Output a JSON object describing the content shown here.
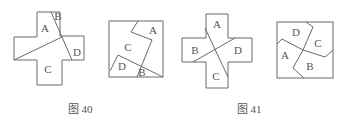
{
  "figures": [
    {
      "caption": "图 40",
      "cross": {
        "labels": {
          "A": "A",
          "B": "B",
          "C": "C",
          "D": "D"
        }
      },
      "square": {
        "labels": {
          "A": "A",
          "B": "B",
          "C": "C",
          "D": "D"
        }
      }
    },
    {
      "caption": "图 41",
      "cross": {
        "labels": {
          "A": "A",
          "B": "B",
          "C": "C",
          "D": "D"
        }
      },
      "square": {
        "labels": {
          "A": "A",
          "B": "B",
          "C": "C",
          "D": "D"
        }
      }
    }
  ],
  "colors": {
    "line": "#6a6a6a",
    "text": "#555555",
    "background": "#ffffff"
  }
}
